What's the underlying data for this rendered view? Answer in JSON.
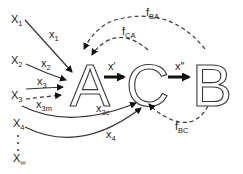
{
  "diagram": {
    "nodes": {
      "A": "A",
      "C": "C",
      "B": "B"
    },
    "inputs": {
      "x1": {
        "main": "X",
        "sub": "1"
      },
      "x2": {
        "main": "X",
        "sub": "2"
      },
      "x3": {
        "main": "X",
        "sub": "3"
      },
      "x4": {
        "main": "X",
        "sub": "4"
      },
      "xinf": {
        "main": "X",
        "sub": "∞"
      },
      "ellipsis": "⋮"
    },
    "edges": {
      "x1": {
        "main": "x",
        "sub": "1"
      },
      "x2": {
        "main": "x",
        "sub": "2"
      },
      "x3": {
        "main": "x",
        "sub": "3"
      },
      "x3m": {
        "main": "x",
        "sub": "3m"
      },
      "x3c": {
        "main": "x",
        "sub": "3c"
      },
      "x4": {
        "main": "x",
        "sub": "4"
      },
      "xprime": "x′",
      "xdoubleprime": "x″",
      "fBA": {
        "main": "f",
        "sub": "BA"
      },
      "fCA": {
        "main": "f",
        "sub": "CA"
      },
      "fBC": {
        "main": "f",
        "sub": "BC"
      }
    },
    "colors": {
      "stroke": "#333333",
      "background": "#ffffff"
    }
  }
}
